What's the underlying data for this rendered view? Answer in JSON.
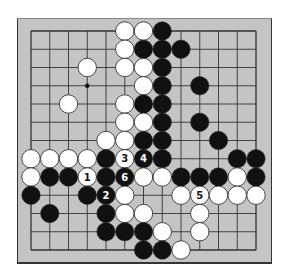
{
  "diagram": {
    "type": "go-board-diagram",
    "board_size": 13,
    "colors": {
      "board": "#c4c4c4",
      "line": "#333333",
      "black": "#111111",
      "white": "#ffffff"
    },
    "hoshi": [
      [
        3,
        3
      ]
    ],
    "stones": [
      {
        "c": 5,
        "r": 0,
        "color": "white"
      },
      {
        "c": 6,
        "r": 0,
        "color": "white"
      },
      {
        "c": 7,
        "r": 0,
        "color": "black"
      },
      {
        "c": 5,
        "r": 1,
        "color": "white"
      },
      {
        "c": 6,
        "r": 1,
        "color": "black"
      },
      {
        "c": 7,
        "r": 1,
        "color": "black"
      },
      {
        "c": 8,
        "r": 1,
        "color": "black"
      },
      {
        "c": 3,
        "r": 2,
        "color": "white"
      },
      {
        "c": 5,
        "r": 2,
        "color": "white"
      },
      {
        "c": 6,
        "r": 2,
        "color": "white"
      },
      {
        "c": 7,
        "r": 2,
        "color": "black"
      },
      {
        "c": 6,
        "r": 3,
        "color": "white"
      },
      {
        "c": 7,
        "r": 3,
        "color": "black"
      },
      {
        "c": 9,
        "r": 3,
        "color": "black"
      },
      {
        "c": 2,
        "r": 4,
        "color": "white"
      },
      {
        "c": 5,
        "r": 4,
        "color": "white"
      },
      {
        "c": 6,
        "r": 4,
        "color": "black"
      },
      {
        "c": 7,
        "r": 4,
        "color": "black"
      },
      {
        "c": 5,
        "r": 5,
        "color": "white"
      },
      {
        "c": 6,
        "r": 5,
        "color": "white"
      },
      {
        "c": 7,
        "r": 5,
        "color": "black"
      },
      {
        "c": 9,
        "r": 5,
        "color": "black"
      },
      {
        "c": 4,
        "r": 6,
        "color": "white"
      },
      {
        "c": 5,
        "r": 6,
        "color": "white"
      },
      {
        "c": 6,
        "r": 6,
        "color": "black"
      },
      {
        "c": 7,
        "r": 6,
        "color": "black"
      },
      {
        "c": 10,
        "r": 6,
        "color": "black"
      },
      {
        "c": 0,
        "r": 7,
        "color": "white"
      },
      {
        "c": 1,
        "r": 7,
        "color": "white"
      },
      {
        "c": 2,
        "r": 7,
        "color": "white"
      },
      {
        "c": 3,
        "r": 7,
        "color": "white"
      },
      {
        "c": 4,
        "r": 7,
        "color": "black"
      },
      {
        "c": 5,
        "r": 7,
        "color": "white",
        "label": "3"
      },
      {
        "c": 6,
        "r": 7,
        "color": "black",
        "label": "4"
      },
      {
        "c": 7,
        "r": 7,
        "color": "black"
      },
      {
        "c": 11,
        "r": 7,
        "color": "black"
      },
      {
        "c": 12,
        "r": 7,
        "color": "black"
      },
      {
        "c": 0,
        "r": 8,
        "color": "white"
      },
      {
        "c": 1,
        "r": 8,
        "color": "black"
      },
      {
        "c": 2,
        "r": 8,
        "color": "black"
      },
      {
        "c": 3,
        "r": 8,
        "color": "white",
        "label": "1"
      },
      {
        "c": 4,
        "r": 8,
        "color": "black"
      },
      {
        "c": 5,
        "r": 8,
        "color": "black",
        "label": "6"
      },
      {
        "c": 6,
        "r": 8,
        "color": "white"
      },
      {
        "c": 7,
        "r": 8,
        "color": "white"
      },
      {
        "c": 8,
        "r": 8,
        "color": "black"
      },
      {
        "c": 9,
        "r": 8,
        "color": "black"
      },
      {
        "c": 10,
        "r": 8,
        "color": "black"
      },
      {
        "c": 11,
        "r": 8,
        "color": "white"
      },
      {
        "c": 12,
        "r": 8,
        "color": "black"
      },
      {
        "c": 0,
        "r": 9,
        "color": "black"
      },
      {
        "c": 3,
        "r": 9,
        "color": "black"
      },
      {
        "c": 4,
        "r": 9,
        "color": "black",
        "label": "2"
      },
      {
        "c": 5,
        "r": 9,
        "color": "white"
      },
      {
        "c": 8,
        "r": 9,
        "color": "white"
      },
      {
        "c": 9,
        "r": 9,
        "color": "white",
        "label": "5"
      },
      {
        "c": 10,
        "r": 9,
        "color": "white"
      },
      {
        "c": 11,
        "r": 9,
        "color": "white"
      },
      {
        "c": 12,
        "r": 9,
        "color": "white"
      },
      {
        "c": 1,
        "r": 10,
        "color": "black"
      },
      {
        "c": 4,
        "r": 10,
        "color": "black"
      },
      {
        "c": 5,
        "r": 10,
        "color": "white"
      },
      {
        "c": 6,
        "r": 10,
        "color": "white"
      },
      {
        "c": 9,
        "r": 10,
        "color": "white"
      },
      {
        "c": 4,
        "r": 11,
        "color": "black"
      },
      {
        "c": 5,
        "r": 11,
        "color": "black"
      },
      {
        "c": 6,
        "r": 11,
        "color": "black"
      },
      {
        "c": 7,
        "r": 11,
        "color": "white"
      },
      {
        "c": 9,
        "r": 11,
        "color": "white"
      },
      {
        "c": 6,
        "r": 12,
        "color": "black"
      },
      {
        "c": 7,
        "r": 12,
        "color": "black"
      },
      {
        "c": 8,
        "r": 12,
        "color": "white"
      }
    ],
    "move_labels": [
      "1",
      "2",
      "3",
      "4",
      "5",
      "6"
    ]
  }
}
